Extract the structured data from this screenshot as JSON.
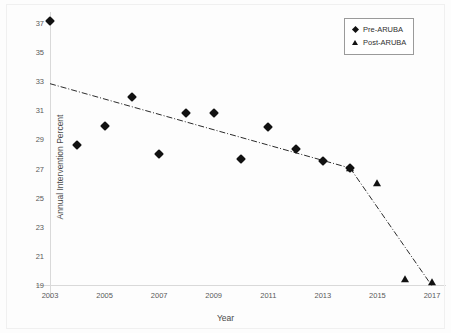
{
  "chart_data": {
    "type": "scatter",
    "title": "",
    "xlabel": "Year",
    "ylabel": "Annual Intervention Percent",
    "xlim": [
      2003,
      2017
    ],
    "ylim": [
      19,
      37
    ],
    "xticks": [
      2003,
      2005,
      2007,
      2009,
      2011,
      2013,
      2015,
      2017
    ],
    "yticks": [
      19,
      21,
      23,
      25,
      27,
      29,
      31,
      33,
      35,
      37
    ],
    "grid": false,
    "legend_position": "top-right",
    "series": [
      {
        "name": "Pre-ARUBA",
        "marker": "diamond",
        "color": "#111111",
        "points": [
          {
            "x": 2003,
            "y": 37.2
          },
          {
            "x": 2004,
            "y": 28.7
          },
          {
            "x": 2005,
            "y": 30.0
          },
          {
            "x": 2006,
            "y": 32.0
          },
          {
            "x": 2007,
            "y": 28.1
          },
          {
            "x": 2008,
            "y": 30.9
          },
          {
            "x": 2009,
            "y": 30.9
          },
          {
            "x": 2010,
            "y": 27.7
          },
          {
            "x": 2011,
            "y": 29.9
          },
          {
            "x": 2012,
            "y": 28.4
          },
          {
            "x": 2013,
            "y": 27.6
          },
          {
            "x": 2014,
            "y": 27.1
          }
        ]
      },
      {
        "name": "Post-ARUBA",
        "marker": "triangle",
        "color": "#111111",
        "points": [
          {
            "x": 2014,
            "y": 27.1
          },
          {
            "x": 2015,
            "y": 26.1
          },
          {
            "x": 2016,
            "y": 19.5
          },
          {
            "x": 2017,
            "y": 19.3
          }
        ]
      }
    ],
    "trend_lines": [
      {
        "name": "pre-aruba-trend",
        "x1": 2003,
        "y1": 32.9,
        "x2": 2014,
        "y2": 27.1,
        "style": "dash-dot"
      },
      {
        "name": "post-aruba-trend",
        "x1": 2014,
        "y1": 27.1,
        "x2": 2017,
        "y2": 19.0,
        "style": "dash-dot"
      }
    ]
  },
  "legend": {
    "items": [
      {
        "label": "Pre-ARUBA",
        "marker": "diamond"
      },
      {
        "label": "Post-ARUBA",
        "marker": "triangle"
      }
    ]
  },
  "axis": {
    "y_title": "Annual Intervention Percent",
    "x_title": "Year"
  }
}
